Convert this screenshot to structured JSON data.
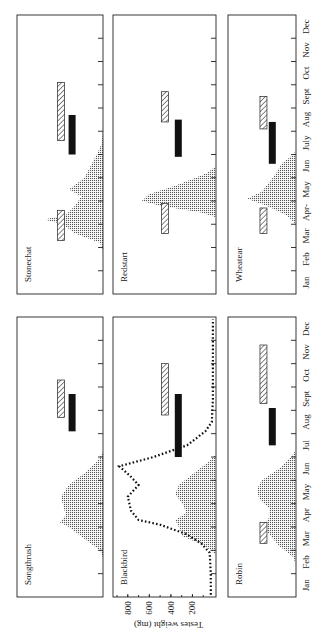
{
  "chart_data": {
    "type": "area",
    "orientation": "rotated 90° counter-clockwise (month axis vertical, Jan at bottom)",
    "title": "",
    "xlabel": "Month",
    "months": [
      "Jan",
      "Feb",
      "Mar",
      "Apr",
      "May",
      "Jun",
      "Jul",
      "Aug",
      "Sept",
      "Oct",
      "Nov",
      "Dec"
    ],
    "month_labels_upper_row": [
      "Jan",
      "Feb",
      "Mar",
      "Apr‐",
      "May",
      "Jun",
      "July",
      "Aug",
      "Sept",
      "Oct",
      "Nov",
      "Dec"
    ],
    "month_labels_lower_row": [
      "Jan",
      "Feb",
      "Mar",
      "Apr",
      "May",
      "Jun",
      "Jul",
      "Aug",
      "Sept",
      "Oct",
      "Nov",
      "Dec"
    ],
    "legend_hint": {
      "stippled_area": "breeding (egg-laying) distribution",
      "solid_bar": "moult period",
      "hatched_bar": "migration / passage period"
    },
    "panels": [
      {
        "species": "Stonechat",
        "row": "upper",
        "col": 0,
        "distribution": [
          [
            1.9,
            0
          ],
          [
            2.2,
            0.05
          ],
          [
            2.6,
            0.45
          ],
          [
            3.0,
            0.65
          ],
          [
            3.2,
            0.95
          ],
          [
            3.4,
            0.6
          ],
          [
            3.8,
            0.45
          ],
          [
            4.2,
            0.35
          ],
          [
            4.5,
            0.55
          ],
          [
            5.0,
            0.3
          ],
          [
            5.5,
            0.2
          ],
          [
            6.0,
            0.1
          ],
          [
            6.5,
            0.02
          ],
          [
            7.0,
            0
          ]
        ],
        "hatched_bars": [
          [
            2.3,
            3.6
          ],
          [
            6.6,
            9.1
          ]
        ],
        "solid_bars": [
          [
            6.0,
            7.7
          ]
        ]
      },
      {
        "species": "Redstart",
        "row": "upper",
        "col": 1,
        "distribution": [
          [
            3.3,
            0
          ],
          [
            3.5,
            0.2
          ],
          [
            3.8,
            0.75
          ],
          [
            4.0,
            1.0
          ],
          [
            4.3,
            0.9
          ],
          [
            4.6,
            0.6
          ],
          [
            4.9,
            0.35
          ],
          [
            5.2,
            0.12
          ],
          [
            5.5,
            0
          ]
        ],
        "hatched_bars": [
          [
            2.6,
            3.9
          ],
          [
            7.4,
            8.7
          ]
        ],
        "solid_bars": [
          [
            5.9,
            7.5
          ]
        ]
      },
      {
        "species": "Wheatear",
        "row": "upper",
        "col": 2,
        "distribution": [
          [
            3.0,
            0
          ],
          [
            3.4,
            0.2
          ],
          [
            3.8,
            0.6
          ],
          [
            4.1,
            1.0
          ],
          [
            4.4,
            0.7
          ],
          [
            4.8,
            0.55
          ],
          [
            5.2,
            0.4
          ],
          [
            5.6,
            0.3
          ],
          [
            6.0,
            0.05
          ],
          [
            6.2,
            0
          ]
        ],
        "hatched_bars": [
          [
            2.6,
            3.7
          ],
          [
            7.1,
            8.5
          ]
        ],
        "solid_bars": [
          [
            5.6,
            7.4
          ]
        ]
      },
      {
        "species": "Songthrush",
        "row": "lower",
        "col": 0,
        "distribution": [
          [
            1.7,
            0
          ],
          [
            2.0,
            0.05
          ],
          [
            2.5,
            0.3
          ],
          [
            3.0,
            0.55
          ],
          [
            3.2,
            0.7
          ],
          [
            3.5,
            0.6
          ],
          [
            4.0,
            0.65
          ],
          [
            4.3,
            0.68
          ],
          [
            4.8,
            0.55
          ],
          [
            5.3,
            0.3
          ],
          [
            5.8,
            0.1
          ],
          [
            6.2,
            0
          ]
        ],
        "hatched_bars": [
          [
            7.7,
            9.3
          ]
        ],
        "solid_bars": [
          [
            7.1,
            8.7
          ]
        ]
      },
      {
        "species": "Blackbird",
        "row": "lower",
        "col": 1,
        "distribution": [
          [
            1.8,
            0
          ],
          [
            2.2,
            0.15
          ],
          [
            2.6,
            0.45
          ],
          [
            3.0,
            0.5
          ],
          [
            3.3,
            0.55
          ],
          [
            3.6,
            0.4
          ],
          [
            4.0,
            0.45
          ],
          [
            4.4,
            0.55
          ],
          [
            4.8,
            0.5
          ],
          [
            5.3,
            0.3
          ],
          [
            5.8,
            0.1
          ],
          [
            6.1,
            0
          ]
        ],
        "hatched_bars": [
          [
            7.8,
            10.0
          ]
        ],
        "solid_bars": [
          [
            6.0,
            8.7
          ]
        ],
        "testes_weight_mg": {
          "axis_label": "Testes weight (mg)",
          "ticks": [
            800,
            600,
            400,
            200
          ],
          "ylim": [
            0,
            900
          ],
          "points": [
            [
              0.1,
              30
            ],
            [
              1.0,
              30
            ],
            [
              1.9,
              40
            ],
            [
              2.3,
              120
            ],
            [
              2.7,
              260
            ],
            [
              3.1,
              500
            ],
            [
              3.3,
              700
            ],
            [
              3.7,
              770
            ],
            [
              4.3,
              800
            ],
            [
              4.8,
              700
            ],
            [
              5.2,
              780
            ],
            [
              5.6,
              880
            ],
            [
              6.0,
              560
            ],
            [
              6.5,
              250
            ],
            [
              7.1,
              80
            ],
            [
              7.5,
              20
            ],
            [
              8.5,
              10
            ],
            [
              11.9,
              10
            ]
          ]
        }
      },
      {
        "species": "Robin",
        "row": "lower",
        "col": 2,
        "distribution": [
          [
            1.3,
            0
          ],
          [
            1.7,
            0.05
          ],
          [
            2.2,
            0.35
          ],
          [
            2.7,
            0.55
          ],
          [
            3.0,
            0.7
          ],
          [
            3.4,
            0.55
          ],
          [
            3.8,
            0.55
          ],
          [
            4.2,
            0.75
          ],
          [
            4.6,
            0.8
          ],
          [
            5.0,
            0.7
          ],
          [
            5.5,
            0.35
          ],
          [
            6.0,
            0.1
          ],
          [
            6.3,
            0
          ]
        ],
        "hatched_bars": [
          [
            2.3,
            3.2
          ],
          [
            8.3,
            10.8
          ]
        ],
        "solid_bars": [
          [
            6.5,
            8.1
          ]
        ]
      }
    ]
  },
  "labels": {
    "testes_axis": "Testes weight (mg)"
  }
}
